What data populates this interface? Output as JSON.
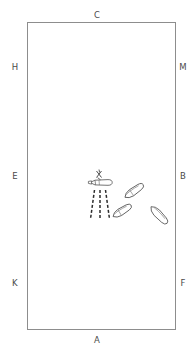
{
  "diagram": {
    "type": "schematic-plan-view",
    "background_color": "#ffffff",
    "field": {
      "shape": "rectangle",
      "border_color": "#8d8d8d",
      "fill_color": "#ffffff",
      "x": 27,
      "y": 22,
      "width": 149,
      "height": 308
    },
    "edge_labels": {
      "top": "C",
      "bottom": "A",
      "left_upper": "H",
      "left_middle": "E",
      "left_lower": "K",
      "right_upper": "M",
      "right_middle": "B",
      "right_lower": "F"
    },
    "label_color": "#4a4a4a",
    "marker": {
      "name": "x-mark",
      "label": "X",
      "x": 100,
      "y": 174
    },
    "emitter": {
      "name": "horizontal-capsule-object",
      "x": 101,
      "y": 182,
      "stroke_color": "#555555"
    },
    "dashed_rays": {
      "count": 3,
      "stroke_color": "#2e2e2e",
      "dash_pattern": "3 2",
      "origin_x": 100,
      "origin_y": 190,
      "length": 30
    },
    "scattered_objects": [
      {
        "name": "teardrop-object-1",
        "x": 134,
        "y": 191,
        "rotation": -35
      },
      {
        "name": "teardrop-object-2",
        "x": 122,
        "y": 211,
        "rotation": -32
      },
      {
        "name": "teardrop-object-3",
        "x": 159,
        "y": 215,
        "rotation": -20
      },
      {
        "name": "teardrop-object-4",
        "x": 104,
        "y": 183,
        "rotation": 0
      }
    ]
  }
}
